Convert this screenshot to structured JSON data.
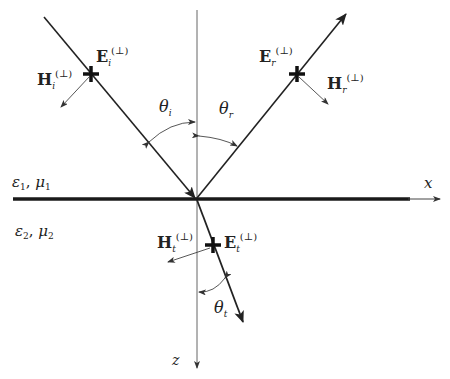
{
  "diagram": {
    "axes": {
      "x_label": "x",
      "z_label": "z"
    },
    "media": {
      "upper": {
        "eps": "ε",
        "eps_sub": "1",
        "sep": ", ",
        "mu": "μ",
        "mu_sub": "1"
      },
      "lower": {
        "eps": "ε",
        "eps_sub": "2",
        "sep": ", ",
        "mu": "μ",
        "mu_sub": "2"
      }
    },
    "incident": {
      "E": "E",
      "E_sub": "i",
      "E_sup": "(⊥)",
      "H": "H",
      "H_sub": "i",
      "H_sup": "(⊥)",
      "angle": "θ",
      "angle_sub": "i"
    },
    "reflected": {
      "E": "E",
      "E_sub": "r",
      "E_sup": "(⊥)",
      "H": "H",
      "H_sub": "r",
      "H_sup": "(⊥)",
      "angle": "θ",
      "angle_sub": "r"
    },
    "transmitted": {
      "E": "E",
      "E_sub": "t",
      "E_sup": "(⊥)",
      "H": "H",
      "H_sub": "t",
      "H_sup": "(⊥)",
      "angle": "θ",
      "angle_sub": "t"
    },
    "colors": {
      "line": "#222222",
      "axis": "#555555",
      "interface": "#1a1a1a"
    }
  }
}
